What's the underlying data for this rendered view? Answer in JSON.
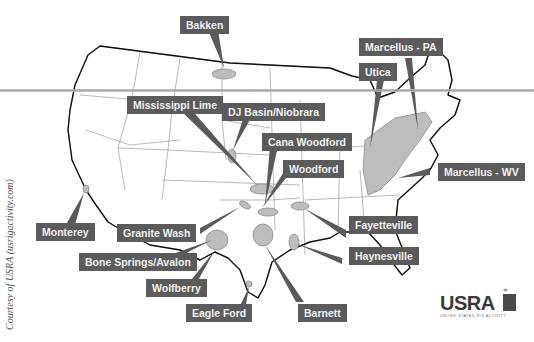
{
  "map": {
    "title": "US Shale Plays",
    "labels": {
      "bakken": "Bakken",
      "marcellus_pa": "Marcellus - PA",
      "utica": "Utica",
      "mississippi_lime": "Mississippi Lime",
      "dj_basin": "DJ Basin/Niobrara",
      "cana_woodford": "Cana Woodford",
      "woodford": "Woodford",
      "marcellus_wv": "Marcellus - WV",
      "monterey": "Monterey",
      "granite_wash": "Granite Wash",
      "fayetteville": "Fayetteville",
      "bone_springs": "Bone Springs/Avalon",
      "haynesville": "Haynesville",
      "wolfberry": "Wolfberry",
      "eagle_ford": "Eagle Ford",
      "barnett": "Barnett"
    },
    "colors": {
      "label_bg": "#5b5b5b",
      "play_fill": "#bdbdbd",
      "label_text": "#f2f2f2"
    }
  },
  "credit": "Courtesy of USRA (usrigactivity.com)",
  "logo": {
    "name": "USRA",
    "subtitle": "UNITED STATES RIG ACTIVITY"
  }
}
